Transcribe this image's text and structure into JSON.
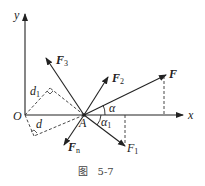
{
  "figure": {
    "caption": "图   5-7",
    "axes": {
      "x_label": "x",
      "y_label": "y",
      "origin_label": "O"
    },
    "point_label": "A",
    "forces": [
      {
        "name": "F",
        "label": "F",
        "subscript": ""
      },
      {
        "name": "F1",
        "label": "F",
        "subscript": "1"
      },
      {
        "name": "F2",
        "label": "F",
        "subscript": "2"
      },
      {
        "name": "F3",
        "label": "F",
        "subscript": "3"
      },
      {
        "name": "Fn",
        "label": "F",
        "subscript": "n"
      }
    ],
    "angles": [
      {
        "name": "alpha",
        "label": "α",
        "subscript": ""
      },
      {
        "name": "alpha1",
        "label": "α",
        "subscript": "1"
      }
    ],
    "distances": [
      {
        "name": "d",
        "label": "d",
        "subscript": ""
      },
      {
        "name": "d1",
        "label": "d",
        "subscript": "1"
      }
    ],
    "colors": {
      "line": "#222222",
      "dashed": "#333333",
      "caption": "#444444"
    }
  }
}
